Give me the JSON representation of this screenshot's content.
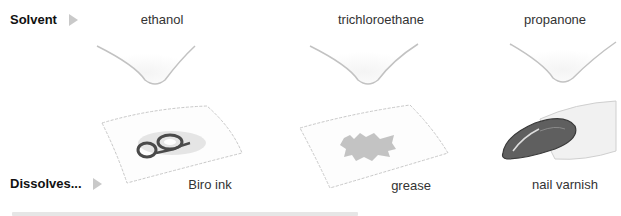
{
  "rows": {
    "solvent_label": "Solvent",
    "dissolves_label": "Dissolves..."
  },
  "columns": [
    {
      "solvent": "ethanol",
      "dissolves": "Biro ink"
    },
    {
      "solvent": "trichloroethane",
      "dissolves": "grease"
    },
    {
      "solvent": "propanone",
      "dissolves": "nail varnish"
    }
  ],
  "icons": {
    "row_arrow": "triangle-right-icon",
    "solvent_dish": "watch-glass-icon",
    "stain_cloth": "stained-cloth-icon",
    "fingernail": "painted-fingernail-icon"
  },
  "colors": {
    "label_text": "#111111",
    "arrow": "#c9c9c9",
    "dish_outline": "#bdbdbd",
    "stain": "#555555",
    "grease": "#b5b5b5"
  }
}
